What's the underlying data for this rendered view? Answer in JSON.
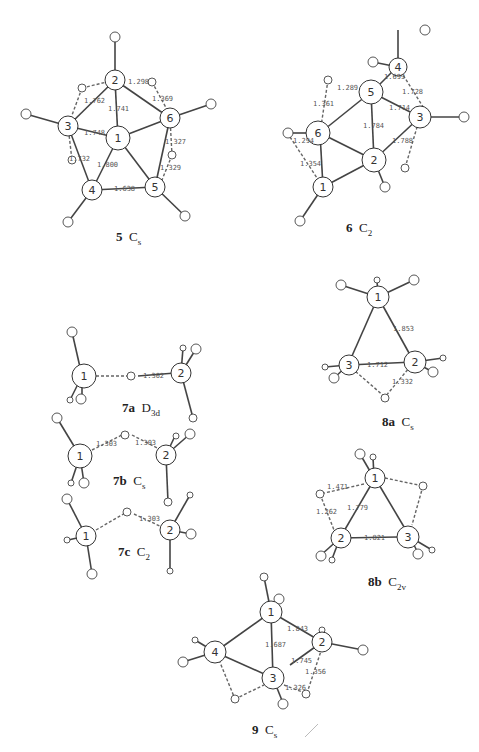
{
  "figure": {
    "structures": [
      {
        "id": "5",
        "label": "5",
        "symmetry": "C",
        "symmetry_sub": "s",
        "atoms": [
          "1",
          "2",
          "3",
          "4",
          "5",
          "6"
        ],
        "bond_lengths": [
          "1.298",
          "1.369",
          "1.762",
          "1.741",
          "1.748",
          "1.327",
          "1.732",
          "1.800",
          "1.329",
          "1.638"
        ]
      },
      {
        "id": "6",
        "label": "6",
        "symmetry": "C",
        "symmetry_sub": "2",
        "atoms": [
          "1",
          "2",
          "3",
          "4",
          "5",
          "6"
        ],
        "bond_lengths": [
          "1.699",
          "1.289",
          "1.728",
          "1.361",
          "1.714",
          "1.784",
          "1.294",
          "1.788",
          "1.354"
        ]
      },
      {
        "id": "7a",
        "label": "7a",
        "symmetry": "D",
        "symmetry_sub": "3d",
        "atoms": [
          "1",
          "2"
        ],
        "bond_lengths": [
          "1.302"
        ]
      },
      {
        "id": "7b",
        "label": "7b",
        "symmetry": "C",
        "symmetry_sub": "s",
        "atoms": [
          "1",
          "2"
        ],
        "bond_lengths": [
          "1.303",
          "1.303"
        ]
      },
      {
        "id": "7c",
        "label": "7c",
        "symmetry": "C",
        "symmetry_sub": "2",
        "atoms": [
          "1",
          "2"
        ],
        "bond_lengths": [
          "1.303"
        ]
      },
      {
        "id": "8a",
        "label": "8a",
        "symmetry": "C",
        "symmetry_sub": "s",
        "atoms": [
          "1",
          "2",
          "3"
        ],
        "bond_lengths": [
          "1.853",
          "1.712",
          "1.332"
        ]
      },
      {
        "id": "8b",
        "label": "8b",
        "symmetry": "C",
        "symmetry_sub": "2v",
        "atoms": [
          "1",
          "2",
          "3"
        ],
        "bond_lengths": [
          "1.471",
          "1.779",
          "1.262",
          "1.821"
        ]
      },
      {
        "id": "9",
        "label": "9",
        "symmetry": "C",
        "symmetry_sub": "s",
        "atoms": [
          "1",
          "2",
          "3",
          "4"
        ],
        "bond_lengths": [
          "1.843",
          "1.687",
          "1.745",
          "1.356",
          "1.326"
        ]
      }
    ]
  }
}
